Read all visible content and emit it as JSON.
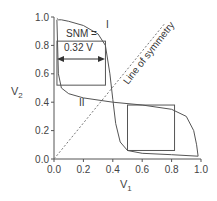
{
  "chart_data": {
    "type": "line",
    "title": "",
    "xlabel": "V1",
    "ylabel": "V2",
    "xlim": [
      0.0,
      1.0
    ],
    "ylim": [
      0.0,
      1.0
    ],
    "x_ticks": [
      "0.0",
      "0.2",
      "0.4",
      "0.6",
      "0.8",
      "1.0"
    ],
    "y_ticks": [
      "0.0",
      "0.2",
      "0.4",
      "0.6",
      "0.8",
      "1.0"
    ],
    "grid": false,
    "series": [
      {
        "name": "I",
        "x": [
          0.02,
          0.03,
          0.05,
          0.1,
          0.2,
          0.3,
          0.35,
          0.38,
          0.4,
          0.42,
          0.45,
          0.5,
          0.6,
          0.8,
          0.98
        ],
        "y": [
          0.99,
          0.98,
          0.98,
          0.97,
          0.94,
          0.88,
          0.8,
          0.6,
          0.42,
          0.25,
          0.12,
          0.06,
          0.04,
          0.03,
          0.02
        ]
      },
      {
        "name": "II",
        "x": [
          0.02,
          0.03,
          0.05,
          0.1,
          0.2,
          0.4,
          0.6,
          0.8,
          0.9,
          0.95,
          0.97,
          0.98
        ],
        "y": [
          0.98,
          0.6,
          0.5,
          0.46,
          0.43,
          0.4,
          0.38,
          0.35,
          0.3,
          0.2,
          0.1,
          0.02
        ]
      }
    ],
    "annotations": [
      {
        "text": "SNM =",
        "x": 0.13,
        "y": 0.76
      },
      {
        "text": "0.32 V",
        "x": 0.13,
        "y": 0.66
      },
      {
        "text": "I",
        "x": 0.37,
        "y": 0.87
      },
      {
        "text": "II",
        "x": 0.18,
        "y": 0.37
      },
      {
        "text": "Line of symmetry",
        "x": 0.55,
        "y": 0.7,
        "rotation": -45
      }
    ],
    "snm_box_top_left": {
      "x": [
        0.02,
        0.35
      ],
      "y": [
        0.52,
        0.83
      ]
    },
    "snm_box_bottom_right": {
      "x": [
        0.5,
        0.82
      ],
      "y": [
        0.06,
        0.38
      ]
    },
    "symmetry_line": {
      "x": [
        0.0,
        0.75
      ],
      "y": [
        0.0,
        0.95
      ]
    }
  },
  "labels": {
    "xlabel_main": "V",
    "xlabel_sub": "1",
    "ylabel_main": "V",
    "ylabel_sub": "2",
    "snm_line1": "SNM =",
    "snm_line2": "0.32 V",
    "curve1": "I",
    "curve2": "II",
    "symmetry": "Line of symmetry"
  }
}
